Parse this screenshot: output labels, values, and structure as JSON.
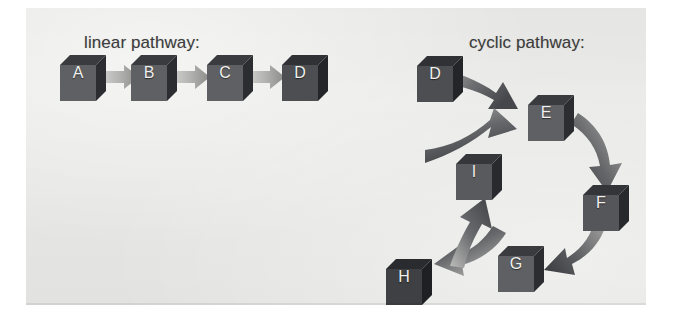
{
  "figure": {
    "background_color": "#ffffff",
    "panel_color": "#e9e9e7",
    "width": 676,
    "height": 328
  },
  "labels": {
    "linear": "linear pathway:",
    "cyclic": "cyclic pathway:"
  },
  "colors": {
    "cube_front": "#5f6063",
    "cube_top": "#3a3b3e",
    "cube_side": "#2c2d30",
    "cube_letter": "#f0f0ee",
    "arrow_straight_light": "#c9c9c7",
    "arrow_straight_dark": "#8d8d8b",
    "arrow_curved_light": "#b4b4b2",
    "arrow_curved_dark": "#4a4b4e",
    "label_text": "#3c3c3c"
  },
  "diagram_data": {
    "type": "diagram",
    "title": "linear pathway and cyclic pathway",
    "panels": [
      {
        "name": "linear-pathway",
        "label": "linear pathway:",
        "node_shape": "cube",
        "nodes": [
          "A",
          "B",
          "C",
          "D"
        ],
        "edges": [
          {
            "from": "A",
            "to": "B",
            "style": "straight-chevron"
          },
          {
            "from": "B",
            "to": "C",
            "style": "straight-chevron"
          },
          {
            "from": "C",
            "to": "D",
            "style": "straight-chevron"
          }
        ]
      },
      {
        "name": "cyclic-pathway",
        "label": "cyclic pathway:",
        "node_shape": "cube",
        "nodes": [
          "D",
          "E",
          "F",
          "G",
          "H",
          "I"
        ],
        "edges": [
          {
            "from": "D",
            "to": "E",
            "style": "curved"
          },
          {
            "from": "E",
            "to": "F",
            "style": "curved"
          },
          {
            "from": "F",
            "to": "G",
            "style": "curved"
          },
          {
            "from": "G",
            "to": "H",
            "style": "curved"
          },
          {
            "from": "H",
            "to": "I",
            "style": "curved"
          },
          {
            "from": "I",
            "to": "E",
            "style": "curved"
          }
        ],
        "cycle": [
          "E",
          "F",
          "G",
          "H",
          "I",
          "E"
        ]
      }
    ]
  },
  "linear_pathway": {
    "label": "linear pathway:",
    "cubes": [
      {
        "letter": "A"
      },
      {
        "letter": "B"
      },
      {
        "letter": "C"
      },
      {
        "letter": "D"
      }
    ]
  },
  "cyclic_pathway": {
    "label": "cyclic pathway:",
    "cubes": [
      {
        "letter": "D"
      },
      {
        "letter": "E"
      },
      {
        "letter": "F"
      },
      {
        "letter": "G"
      },
      {
        "letter": "H"
      },
      {
        "letter": "I"
      }
    ]
  }
}
